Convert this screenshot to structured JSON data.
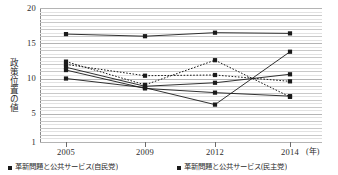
{
  "chart_data": {
    "type": "line",
    "title": "",
    "xlabel": "(年)",
    "ylabel": "政策位置の値",
    "categories": [
      "2005",
      "2009",
      "2012",
      "2014"
    ],
    "x": [
      2005,
      2009,
      2012,
      2014
    ],
    "ylim": [
      1,
      20
    ],
    "yticks": [
      1,
      5,
      10,
      15,
      20
    ],
    "ytick_labels": [
      "1",
      "5",
      "10",
      "15",
      "20"
    ],
    "minor_gridlines": true,
    "grid": true,
    "legend_position": "bottom",
    "series": [
      {
        "name": "series-1-top",
        "style": "solid",
        "marker": "square",
        "values": [
          16.3,
          16.0,
          16.5,
          16.4
        ]
      },
      {
        "name": "series-2",
        "style": "dotted",
        "marker": "square",
        "values": [
          12.4,
          9.1,
          12.6,
          7.4
        ]
      },
      {
        "name": "series-3",
        "style": "dotted",
        "marker": "square",
        "values": [
          12.0,
          10.4,
          10.5,
          9.6
        ]
      },
      {
        "name": "series-4",
        "style": "solid",
        "marker": "square",
        "values": [
          11.6,
          8.9,
          9.4,
          10.6
        ]
      },
      {
        "name": "series-5",
        "style": "solid",
        "marker": "square",
        "values": [
          11.2,
          8.6,
          8.0,
          7.5
        ]
      },
      {
        "name": "series-6",
        "style": "solid",
        "marker": "square",
        "values": [
          10.0,
          8.7,
          6.3,
          13.8
        ]
      }
    ],
    "colors": {
      "line": "#1a1a1a",
      "marker": "#1a1a1a",
      "grid": "#c9c9c9",
      "axis": "#8a8a8a",
      "text": "#2b2b2b"
    }
  },
  "axis": {
    "y_label": "政策位置の値",
    "x_unit": "(年)",
    "y_tick_labels": [
      "20",
      "15",
      "10",
      "5",
      "1"
    ],
    "x_tick_labels": [
      "2005",
      "2009",
      "2012",
      "2014"
    ]
  },
  "legend": {
    "items": [
      {
        "label": "革新問題と公共サービス(自民党)",
        "marker": "square-marker"
      },
      {
        "label": "革新問題と公共サービス(民主党)",
        "marker": "square-marker"
      }
    ]
  }
}
